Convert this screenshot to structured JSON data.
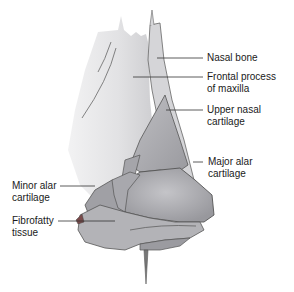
{
  "diagram": {
    "labels": [
      {
        "id": "nasal-bone",
        "text": "Nasal bone"
      },
      {
        "id": "frontal-process",
        "text": "Frontal process\nof maxilla"
      },
      {
        "id": "upper-nasal-cartilage",
        "text": "Upper nasal\ncartilage"
      },
      {
        "id": "major-alar-cartilage",
        "text": "Major alar\ncartilage"
      },
      {
        "id": "minor-alar-cartilage",
        "text": "Minor alar\ncartilage"
      },
      {
        "id": "fibrofatty-tissue",
        "text": "Fibrofatty\ntissue"
      }
    ],
    "colors": {
      "bone": "#e4e4e6",
      "bone_shade": "#c9c9cc",
      "cartilage": "#a9a9ad",
      "cartilage_light": "#bdbdc1",
      "cartilage_dark": "#8d8d92",
      "outline": "#555555",
      "leader": "#333333",
      "fibrofatty": "#7a4a4a"
    }
  }
}
